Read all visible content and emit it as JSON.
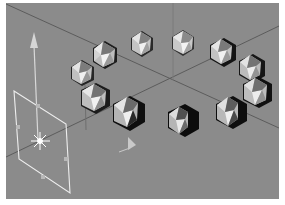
{
  "viewport": {
    "view": "perspective",
    "background_color": "#8b8b8b",
    "grid_line_color": "#5a5a5a",
    "object_count": 12,
    "objects": [
      {
        "name": "icosahedron",
        "x": 105,
        "y": 55,
        "r": 14
      },
      {
        "name": "icosahedron",
        "x": 142,
        "y": 44,
        "r": 13
      },
      {
        "name": "icosahedron",
        "x": 183,
        "y": 43,
        "r": 13
      },
      {
        "name": "icosahedron",
        "x": 222,
        "y": 52,
        "r": 14
      },
      {
        "name": "icosahedron",
        "x": 251,
        "y": 68,
        "r": 14
      },
      {
        "name": "icosahedron",
        "x": 256,
        "y": 92,
        "r": 15
      },
      {
        "name": "icosahedron",
        "x": 230,
        "y": 112,
        "r": 16
      },
      {
        "name": "icosahedron",
        "x": 182,
        "y": 120,
        "r": 16
      },
      {
        "name": "icosahedron",
        "x": 128,
        "y": 113,
        "r": 17
      },
      {
        "name": "icosahedron",
        "x": 95,
        "y": 98,
        "r": 15
      },
      {
        "name": "icosahedron",
        "x": 82,
        "y": 73,
        "r": 13
      }
    ],
    "light": {
      "type": "area-light",
      "handle_color": "#e8e8e8"
    },
    "axis_arrow": {
      "axis": "y",
      "color": "#dcdcdc"
    }
  }
}
